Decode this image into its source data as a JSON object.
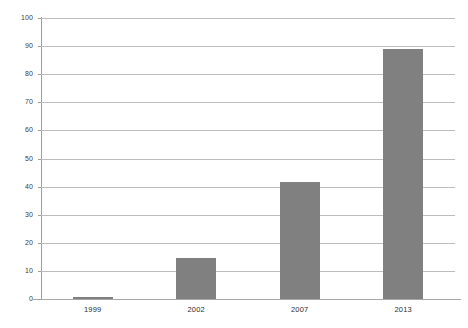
{
  "chart_data": {
    "type": "bar",
    "title": "",
    "subtitle": "",
    "xlabel": "",
    "ylabel": "",
    "categories": [
      "1999",
      "2002",
      "2007",
      "2013"
    ],
    "values": [
      0.7,
      14.5,
      41.5,
      89
    ],
    "series": [
      {
        "name": "",
        "values": [
          0.7,
          14.5,
          41.5,
          89
        ]
      }
    ],
    "ylim": [
      0,
      100
    ],
    "y_ticks": [
      0,
      10,
      20,
      30,
      40,
      50,
      60,
      70,
      80,
      90,
      100
    ],
    "y_tick_labels": [
      "0",
      "10",
      "20",
      "30",
      "40",
      "50",
      "60",
      "70",
      "80",
      "90",
      "100"
    ],
    "grid": true,
    "grid_axis": "y",
    "legend": false,
    "legend_position": "none",
    "bar_color": "#808080",
    "gridline_color": "#bdbdbd",
    "axis_color": "#9e9e9e",
    "background_color": "#ffffff",
    "annotations": []
  },
  "axes": {
    "y": {
      "ticks": [
        {
          "label": "100",
          "value": 100
        },
        {
          "label": "90",
          "value": 90
        },
        {
          "label": "80",
          "value": 80
        },
        {
          "label": "70",
          "value": 70
        },
        {
          "label": "60",
          "value": 60
        },
        {
          "label": "50",
          "value": 50
        },
        {
          "label": "40",
          "value": 40
        },
        {
          "label": "30",
          "value": 30
        },
        {
          "label": "20",
          "value": 20
        },
        {
          "label": "10",
          "value": 10
        },
        {
          "label": "0",
          "value": 0
        }
      ]
    },
    "x": {
      "ticks": [
        {
          "label": "1999"
        },
        {
          "label": "2002"
        },
        {
          "label": "2007"
        },
        {
          "label": "2013"
        }
      ]
    }
  }
}
